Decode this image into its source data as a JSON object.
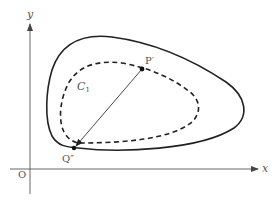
{
  "diagram": {
    "axes": {
      "x_label": "x",
      "y_label": "y",
      "origin_label": "O"
    },
    "curves": {
      "outer": {
        "style": "solid"
      },
      "inner": {
        "style": "dashed",
        "label_main": "C",
        "label_sub": "1"
      }
    },
    "points": {
      "p_prime": {
        "label": "P′"
      },
      "q_double_prime": {
        "label": "Q″"
      }
    },
    "segment": {
      "from": "P′",
      "to": "Q″",
      "arrow_at": "Q″"
    },
    "colors": {
      "stroke": "#222222",
      "axis": "#666666",
      "text": "#555555"
    }
  }
}
